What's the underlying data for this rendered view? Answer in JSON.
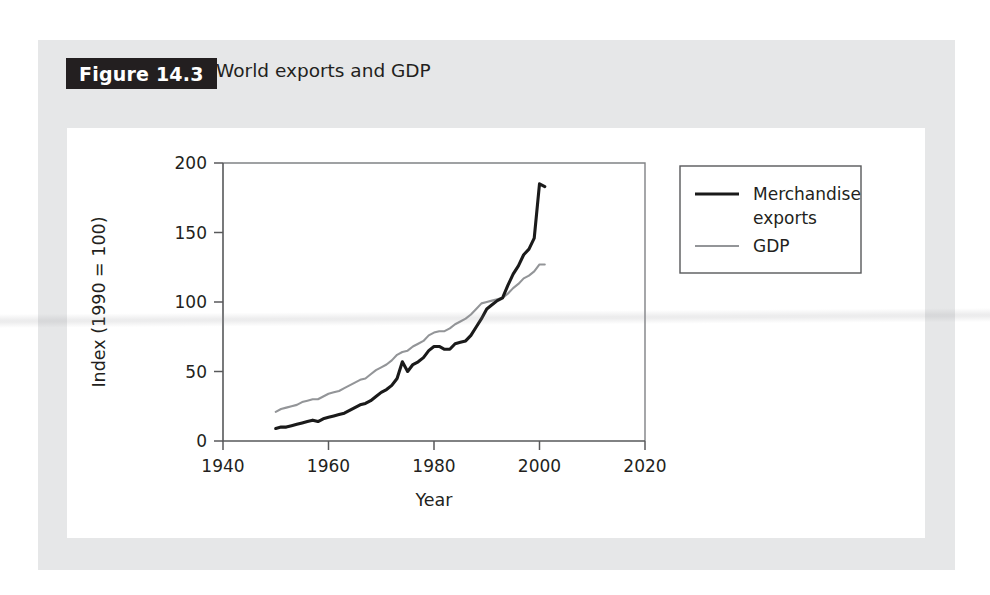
{
  "figure": {
    "badge": "Figure 14.3",
    "title": "World exports and GDP"
  },
  "colors": {
    "card_background": "#e6e7e8",
    "panel_background": "#ffffff",
    "badge_background": "#231f20",
    "exports_line": "#1a1a1a",
    "gdp_line": "#939598",
    "axis": "#58595b"
  },
  "legend": {
    "position": "right",
    "entries": [
      {
        "label": "Merchandise exports",
        "line1": "Merchandise",
        "line2": "exports",
        "color": "#1a1a1a",
        "style": "thick-dark"
      },
      {
        "label": "GDP",
        "line1": "GDP",
        "line2": "",
        "color": "#939598",
        "style": "thin-grey"
      }
    ]
  },
  "chart_data": {
    "type": "line",
    "title": "World exports and GDP",
    "xlabel": "Year",
    "ylabel": "Index (1990 = 100)",
    "xlim": [
      1940,
      2020
    ],
    "ylim": [
      0,
      200
    ],
    "xticks": [
      1940,
      1960,
      1980,
      2000,
      2020
    ],
    "yticks": [
      0,
      50,
      100,
      150,
      200
    ],
    "grid": false,
    "x": [
      1950,
      1951,
      1952,
      1953,
      1954,
      1955,
      1956,
      1957,
      1958,
      1959,
      1960,
      1961,
      1962,
      1963,
      1964,
      1965,
      1966,
      1967,
      1968,
      1969,
      1970,
      1971,
      1972,
      1973,
      1974,
      1975,
      1976,
      1977,
      1978,
      1979,
      1980,
      1981,
      1982,
      1983,
      1984,
      1985,
      1986,
      1987,
      1988,
      1989,
      1990,
      1991,
      1992,
      1993,
      1994,
      1995,
      1996,
      1997,
      1998,
      1999,
      2000,
      2001
    ],
    "series": [
      {
        "name": "Merchandise exports",
        "color": "#1a1a1a",
        "values": [
          9,
          10,
          10,
          11,
          12,
          13,
          14,
          15,
          14,
          16,
          17,
          18,
          19,
          20,
          22,
          24,
          26,
          27,
          29,
          32,
          35,
          37,
          40,
          45,
          57,
          50,
          55,
          57,
          60,
          65,
          68,
          68,
          66,
          66,
          70,
          71,
          72,
          76,
          82,
          88,
          95,
          98,
          101,
          103,
          112,
          120,
          126,
          134,
          138,
          146,
          185,
          183
        ]
      },
      {
        "name": "GDP",
        "color": "#939598",
        "values": [
          21,
          23,
          24,
          25,
          26,
          28,
          29,
          30,
          30,
          32,
          34,
          35,
          36,
          38,
          40,
          42,
          44,
          45,
          48,
          51,
          53,
          55,
          58,
          62,
          64,
          65,
          68,
          70,
          72,
          76,
          78,
          79,
          79,
          81,
          84,
          86,
          88,
          91,
          95,
          99,
          100,
          101,
          102,
          103,
          106,
          110,
          113,
          117,
          119,
          122,
          127,
          127
        ]
      }
    ]
  }
}
